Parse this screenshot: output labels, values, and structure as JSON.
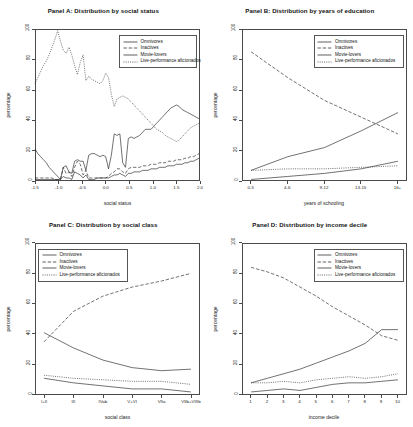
{
  "figure": {
    "ylabel": "percentage",
    "series_names": [
      "Omnivores",
      "Inactives",
      "Movie-lovers",
      "Live-performance aficionados"
    ],
    "yticks": [
      "0",
      "20",
      "40",
      "60",
      "80",
      "100"
    ]
  },
  "chart_data": [
    {
      "type": "line",
      "panel": "A",
      "title": "Panel A: Distribution by social status",
      "xlabel": "social status",
      "ylabel": "percentage",
      "xlim": [
        -1.5,
        2.0
      ],
      "ylim": [
        0,
        100
      ],
      "grid": false,
      "legend_position": "top-right",
      "xticks": [
        "-1.5",
        "-1.0",
        "-0.5",
        "0.0",
        "0.5",
        "1.0",
        "1.5",
        "2.0"
      ],
      "x": [
        -1.5,
        -1.44,
        -1.38,
        -1.32,
        -1.26,
        -1.2,
        -1.14,
        -1.08,
        -1.02,
        -0.96,
        -0.9,
        -0.84,
        -0.78,
        -0.72,
        -0.66,
        -0.6,
        -0.54,
        -0.48,
        -0.42,
        -0.36,
        -0.3,
        -0.24,
        -0.18,
        -0.12,
        -0.06,
        0.0,
        0.06,
        0.12,
        0.18,
        0.24,
        0.3,
        0.36,
        0.42,
        0.48,
        0.54,
        0.6,
        0.66,
        0.72,
        0.78,
        0.84,
        0.9,
        0.96,
        1.02,
        1.08,
        1.14,
        1.2,
        1.26,
        1.32,
        1.38,
        1.44,
        1.5,
        1.56,
        1.62,
        1.68,
        1.74,
        1.8,
        1.86,
        1.92,
        1.98
      ],
      "series": [
        {
          "name": "Omnivores",
          "style": "solid",
          "values": [
            21,
            18,
            16,
            14,
            12,
            9,
            7,
            5,
            3,
            1,
            9,
            10,
            6,
            5,
            13,
            14,
            13,
            13,
            7,
            17,
            18,
            18,
            17,
            16,
            17,
            16,
            8,
            17,
            31,
            30,
            31,
            12,
            9,
            28,
            29,
            28,
            29,
            30,
            32,
            34,
            34,
            34,
            36,
            38,
            40,
            42,
            44,
            46,
            48,
            49,
            50,
            49,
            47,
            46,
            45,
            44,
            43,
            42,
            41
          ]
        },
        {
          "name": "Inactives",
          "style": "dashed",
          "values": [
            2,
            2,
            2,
            2,
            2,
            2,
            2,
            1,
            1,
            1,
            9,
            5,
            6,
            3,
            9,
            13,
            11,
            4,
            7,
            2,
            2,
            2,
            2,
            2,
            2,
            2,
            3,
            5,
            6,
            8,
            8,
            6,
            5,
            8,
            9,
            9,
            9,
            9,
            10,
            10,
            10,
            11,
            11,
            11,
            12,
            12,
            12,
            13,
            13,
            13,
            14,
            14,
            14,
            15,
            15,
            16,
            16,
            17,
            18
          ]
        },
        {
          "name": "Movie-lovers",
          "style": "solid",
          "values": [
            1,
            1,
            1,
            1,
            1,
            1,
            1,
            1,
            1,
            1,
            3,
            2,
            2,
            1,
            6,
            5,
            4,
            2,
            4,
            1,
            1,
            1,
            2,
            2,
            2,
            2,
            2,
            3,
            4,
            4,
            5,
            4,
            3,
            5,
            5,
            6,
            6,
            6,
            7,
            7,
            7,
            8,
            8,
            8,
            9,
            9,
            9,
            10,
            10,
            10,
            11,
            11,
            11,
            12,
            12,
            13,
            13,
            14,
            15
          ]
        },
        {
          "name": "Live-performance aficionados",
          "style": "dotted",
          "values": [
            64,
            68,
            72,
            76,
            79,
            83,
            88,
            93,
            99,
            92,
            86,
            84,
            88,
            83,
            76,
            70,
            78,
            83,
            66,
            69,
            67,
            66,
            65,
            64,
            66,
            71,
            68,
            57,
            49,
            54,
            55,
            56,
            55,
            54,
            52,
            50,
            48,
            46,
            44,
            42,
            40,
            38,
            36,
            34,
            33,
            32,
            30,
            29,
            28,
            27,
            26,
            27,
            29,
            31,
            33,
            35,
            36,
            37,
            38
          ]
        }
      ]
    },
    {
      "type": "line",
      "panel": "B",
      "title": "Panel B: Distribution by years of education",
      "xlabel": "years of schooling",
      "ylabel": "percentage",
      "ylim": [
        0,
        100
      ],
      "grid": false,
      "legend_position": "top-right",
      "categories": [
        "0-3",
        "4-6",
        "9-12",
        "13-15",
        "16+"
      ],
      "xticks": [
        "0-3",
        "4-6",
        "9-12",
        "13-15",
        "16+"
      ],
      "series": [
        {
          "name": "Omnivores",
          "style": "solid",
          "values": [
            7,
            16,
            22,
            33,
            45
          ]
        },
        {
          "name": "Inactives",
          "style": "dashed",
          "values": [
            85,
            68,
            53,
            42,
            31
          ]
        },
        {
          "name": "Movie-lovers",
          "style": "solid",
          "values": [
            1,
            3,
            5,
            8,
            13
          ]
        },
        {
          "name": "Live-performance aficionados",
          "style": "dotted",
          "values": [
            7,
            8,
            8,
            9,
            10
          ]
        }
      ]
    },
    {
      "type": "line",
      "panel": "C",
      "title": "Panel C: Distribution by social class",
      "xlabel": "social class",
      "ylabel": "percentage",
      "ylim": [
        0,
        100
      ],
      "grid": false,
      "legend_position": "top-left",
      "categories": [
        "I+II",
        "III",
        "IVab",
        "V+VI",
        "VIIa",
        "VIIb+VIIIb"
      ],
      "xticks": [
        "I+II",
        "III",
        "IVab",
        "V+VI",
        "VIIa",
        "VIIb+VIIIb"
      ],
      "series": [
        {
          "name": "Omnivores",
          "style": "solid",
          "values": [
            41,
            31,
            23,
            18,
            16,
            17
          ]
        },
        {
          "name": "Inactives",
          "style": "dashed",
          "values": [
            35,
            55,
            65,
            71,
            75,
            80
          ]
        },
        {
          "name": "Movie-lovers",
          "style": "solid",
          "values": [
            11,
            8,
            6,
            4,
            4,
            2
          ]
        },
        {
          "name": "Live-performance aficionados",
          "style": "dotted",
          "values": [
            13,
            11,
            10,
            9,
            9,
            7
          ]
        }
      ]
    },
    {
      "type": "line",
      "panel": "D",
      "title": "Panel D: Distribution by income decile",
      "xlabel": "income decile",
      "ylabel": "percentage",
      "ylim": [
        0,
        100
      ],
      "grid": false,
      "legend_position": "top-right",
      "categories": [
        "1",
        "2",
        "3",
        "4",
        "5",
        "6",
        "7",
        "8",
        "9",
        "10"
      ],
      "xticks": [
        "1",
        "2",
        "3",
        "4",
        "5",
        "6",
        "7",
        "8",
        "9",
        "10"
      ],
      "series": [
        {
          "name": "Omnivores",
          "style": "solid",
          "values": [
            8,
            11,
            14,
            17,
            21,
            25,
            29,
            34,
            43,
            43
          ]
        },
        {
          "name": "Inactives",
          "style": "dashed",
          "values": [
            84,
            81,
            77,
            71,
            65,
            58,
            52,
            46,
            39,
            36
          ]
        },
        {
          "name": "Movie-lovers",
          "style": "solid",
          "values": [
            2,
            3,
            4,
            3,
            5,
            7,
            8,
            8,
            9,
            10
          ]
        },
        {
          "name": "Live-performance aficionados",
          "style": "dotted",
          "values": [
            8,
            8,
            9,
            8,
            10,
            11,
            12,
            11,
            12,
            14
          ]
        }
      ]
    }
  ]
}
